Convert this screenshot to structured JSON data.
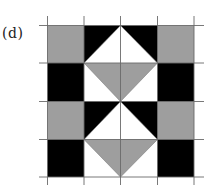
{
  "figure": {
    "label": "(d)",
    "grid": {
      "rows": 4,
      "cols": 4,
      "x_lines": [
        47.5,
        84,
        120.5,
        157.5,
        194
      ],
      "y_lines": [
        25.5,
        63,
        101.5,
        139.5,
        177
      ],
      "line_color": "#6a6a6a"
    },
    "colors": {
      "gray": "#9e9e9e",
      "black": "#000000",
      "white": "#ffffff"
    },
    "cells": [
      [
        "gray",
        "black/white-tri",
        "black/white-tri",
        "gray"
      ],
      [
        "black",
        "white/gray-tri",
        "white/gray-tri",
        "black"
      ],
      [
        "gray",
        "black/white-tri",
        "black/white-tri",
        "gray"
      ],
      [
        "black",
        "white/gray-tri",
        "white/gray-tri",
        "black"
      ]
    ]
  }
}
